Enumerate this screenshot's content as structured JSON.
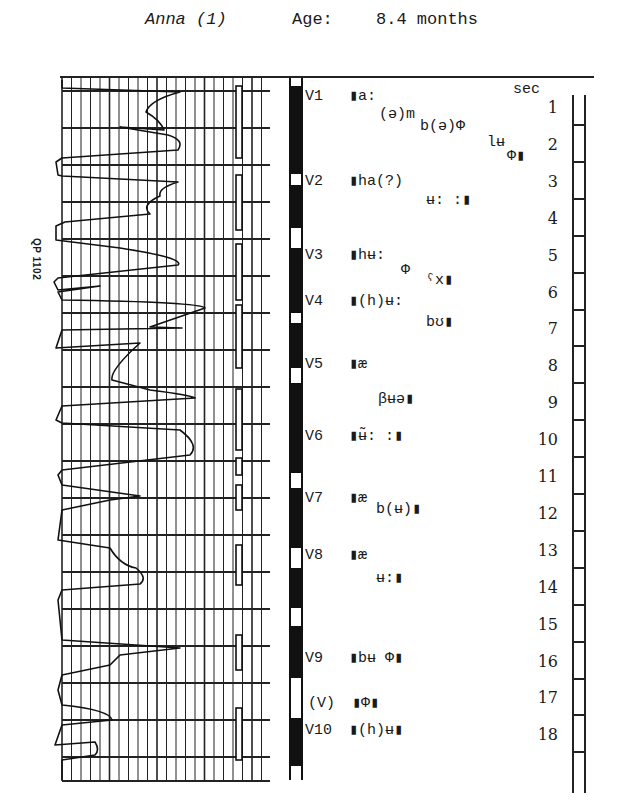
{
  "header": {
    "subject": "Anna (1)",
    "age_label": "Age:",
    "age_value": "8.4 months"
  },
  "side_label": "QP 1102",
  "voicing_bar": {
    "top": 78,
    "height": 702,
    "black_segments": [
      [
        8,
        96
      ],
      [
        107,
        150
      ],
      [
        170,
        235
      ],
      [
        245,
        290
      ],
      [
        305,
        395
      ],
      [
        410,
        470
      ],
      [
        490,
        530
      ],
      [
        548,
        600
      ],
      [
        640,
        688
      ]
    ]
  },
  "transcription": {
    "lines": [
      {
        "id": "V1",
        "label": "V1",
        "text": "▮a:",
        "x": 305,
        "y": 86
      },
      {
        "id": "V1b",
        "label": "",
        "text": "(ə)m",
        "x": 379,
        "y": 106
      },
      {
        "id": "V1c",
        "label": "",
        "text": "b(ə)Φ",
        "x": 420,
        "y": 118
      },
      {
        "id": "V1d",
        "label": "",
        "text": "lʉ",
        "x": 487,
        "y": 134
      },
      {
        "id": "V1e",
        "label": "",
        "text": "Φ▮",
        "x": 507,
        "y": 146
      },
      {
        "id": "V2",
        "label": "V2",
        "text": "▮ha(?)",
        "x": 305,
        "y": 171
      },
      {
        "id": "V2b",
        "label": "",
        "text": "ʉ: :▮",
        "x": 426,
        "y": 190
      },
      {
        "id": "V3",
        "label": "V3",
        "text": "▮hʉ:",
        "x": 305,
        "y": 245
      },
      {
        "id": "V3b",
        "label": "",
        "text": "Φ",
        "x": 401,
        "y": 262
      },
      {
        "id": "V3c",
        "label": "",
        "text": "ˤx▮",
        "x": 426,
        "y": 270
      },
      {
        "id": "V4",
        "label": "V4",
        "text": "▮(h)ʉ:",
        "x": 305,
        "y": 291
      },
      {
        "id": "V4b",
        "label": "",
        "text": "bʊ▮",
        "x": 426,
        "y": 312
      },
      {
        "id": "V5",
        "label": "V5",
        "text": "▮æ",
        "x": 305,
        "y": 354
      },
      {
        "id": "V5b",
        "label": "",
        "text": "βʉə▮",
        "x": 378,
        "y": 389
      },
      {
        "id": "V6",
        "label": "V6",
        "text": "▮ʉ̃: :▮",
        "x": 305,
        "y": 426
      },
      {
        "id": "V7",
        "label": "V7",
        "text": "▮æ",
        "x": 305,
        "y": 488
      },
      {
        "id": "V7b",
        "label": "",
        "text": "b(ʉ)▮",
        "x": 376,
        "y": 499
      },
      {
        "id": "V8",
        "label": "V8",
        "text": "▮æ",
        "x": 305,
        "y": 545
      },
      {
        "id": "V8b",
        "label": "",
        "text": "ʉ:▮",
        "x": 376,
        "y": 568
      },
      {
        "id": "V9",
        "label": "V9",
        "text": "▮bʉ Φ▮",
        "x": 305,
        "y": 648
      },
      {
        "id": "V_",
        "label": "(V)",
        "text": "▮Φ▮",
        "x": 308,
        "y": 693
      },
      {
        "id": "V10",
        "label": "V10",
        "text": "▮(h)ʉ▮",
        "x": 305,
        "y": 720
      }
    ]
  },
  "time_scale": {
    "unit_label": "sec",
    "ticks": [
      "1",
      "2",
      "3",
      "4",
      "5",
      "6",
      "7",
      "8",
      "9",
      "10",
      "11",
      "12",
      "13",
      "14",
      "15",
      "16",
      "17",
      "18"
    ]
  },
  "chart_data": {
    "type": "line",
    "title": "Anna (1) Age: 8.4 months",
    "subtitle": "QP 1102",
    "xlabel": "",
    "ylabel": "sec",
    "orientation": "vertical time axis (top to bottom)",
    "time_axis": {
      "unit": "sec",
      "range": [
        0,
        18.5
      ],
      "ticks": [
        1,
        2,
        3,
        4,
        5,
        6,
        7,
        8,
        9,
        10,
        11,
        12,
        13,
        14,
        15,
        16,
        17,
        18
      ]
    },
    "grid": true,
    "annotations": [
      {
        "label": "V1",
        "segments": [
          "▮a:",
          "(ə)m",
          "b(ə)Φ",
          "lʉ",
          "Φ▮"
        ],
        "t_start": 0.3,
        "t_end": 2.3
      },
      {
        "label": "V2",
        "segments": [
          "▮ha(?)",
          "ʉ: :▮"
        ],
        "t_start": 2.7,
        "t_end": 3.6
      },
      {
        "label": "V3",
        "segments": [
          "▮hʉ:",
          "Φ",
          "ˤx▮"
        ],
        "t_start": 4.8,
        "t_end": 5.9
      },
      {
        "label": "V4",
        "segments": [
          "▮(h)ʉ:",
          "bʊ▮"
        ],
        "t_start": 6.1,
        "t_end": 6.9
      },
      {
        "label": "V5",
        "segments": [
          "▮æ",
          "βʉə▮"
        ],
        "t_start": 7.7,
        "t_end": 9.3
      },
      {
        "label": "V6",
        "segments": [
          "▮ʉ̃: :▮"
        ],
        "t_start": 9.6,
        "t_end": 10.4
      },
      {
        "label": "V7",
        "segments": [
          "▮æ",
          "b(ʉ)▮"
        ],
        "t_start": 11.3,
        "t_end": 12.2
      },
      {
        "label": "V8",
        "segments": [
          "▮æ",
          "ʉ:▮"
        ],
        "t_start": 12.8,
        "t_end": 14.1
      },
      {
        "label": "V9",
        "segments": [
          "▮bʉ Φ▮"
        ],
        "t_start": 15.5,
        "t_end": 16.3
      },
      {
        "label": "(V)",
        "segments": [
          "▮Φ▮"
        ],
        "t_start": 16.8,
        "t_end": 17.1
      },
      {
        "label": "V10",
        "segments": [
          "▮(h)ʉ▮"
        ],
        "t_start": 17.3,
        "t_end": 18.0
      }
    ]
  }
}
